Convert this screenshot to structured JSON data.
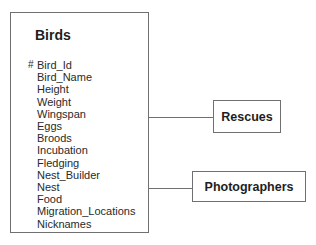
{
  "diagram": {
    "entity": {
      "name": "Birds",
      "primary_key_marker": "#",
      "attributes": [
        "Bird_Id",
        "Bird_Name",
        "Height",
        "Weight",
        "Wingspan",
        "Eggs",
        "Broods",
        "Incubation",
        "Fledging",
        "Nest_Builder",
        "Nest",
        "Food",
        "Migration_Locations",
        "Nicknames"
      ]
    },
    "related_entities": [
      {
        "name": "Rescues"
      },
      {
        "name": "Photographers"
      }
    ],
    "colors": {
      "border": "#707070",
      "text": "#1e1e1e",
      "background": "#ffffff"
    }
  }
}
